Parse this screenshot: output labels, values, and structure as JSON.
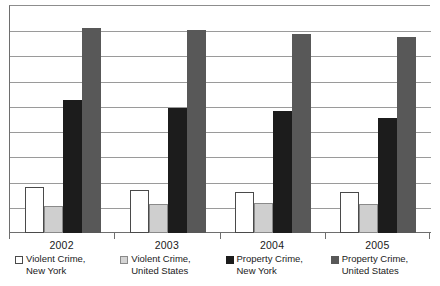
{
  "chart_data": {
    "type": "bar",
    "title": "",
    "subtitle": "",
    "xlabel": "",
    "ylabel": "",
    "categories": [
      "2002",
      "2003",
      "2004",
      "2005"
    ],
    "series": [
      {
        "name": "Violent Crime, New York",
        "legend_label_line1": "Violent Crime,",
        "legend_label_line2": "New York",
        "color": "#ffffff",
        "border_color": "#4a4a4a",
        "swatch": "white-square-swatch",
        "values": [
          496,
          466,
          442,
          442
        ]
      },
      {
        "name": "Violent Crime, United States",
        "legend_label_line1": "Violent Crime,",
        "legend_label_line2": "United States",
        "color": "#cfcfcf",
        "border_color": "#8a8a8a",
        "swatch": "light-gray-square-swatch",
        "values": [
          291,
          313,
          323,
          313
        ]
      },
      {
        "name": "Property Crime, New York",
        "legend_label_line1": "Property Crime,",
        "legend_label_line2": "New York",
        "color": "#1c1c1c",
        "border_color": "#1c1c1c",
        "swatch": "black-square-swatch",
        "values": [
          1434,
          1348,
          1315,
          1240
        ]
      },
      {
        "name": "Property Crime, United States",
        "legend_label_line1": "Property Crime,",
        "legend_label_line2": "United States",
        "color": "#585858",
        "border_color": "#585858",
        "swatch": "dark-gray-square-swatch",
        "values": [
          2211,
          2189,
          2146,
          2113
        ]
      }
    ],
    "ylim": [
      0,
      2450
    ],
    "gridline_count": 8,
    "grid": true,
    "y_tick_labels": [],
    "legend_position": "bottom",
    "axis_color": "#6e6e6e",
    "grid_color": "#9a9a9a"
  },
  "axis": {
    "tick_marks": 5
  }
}
